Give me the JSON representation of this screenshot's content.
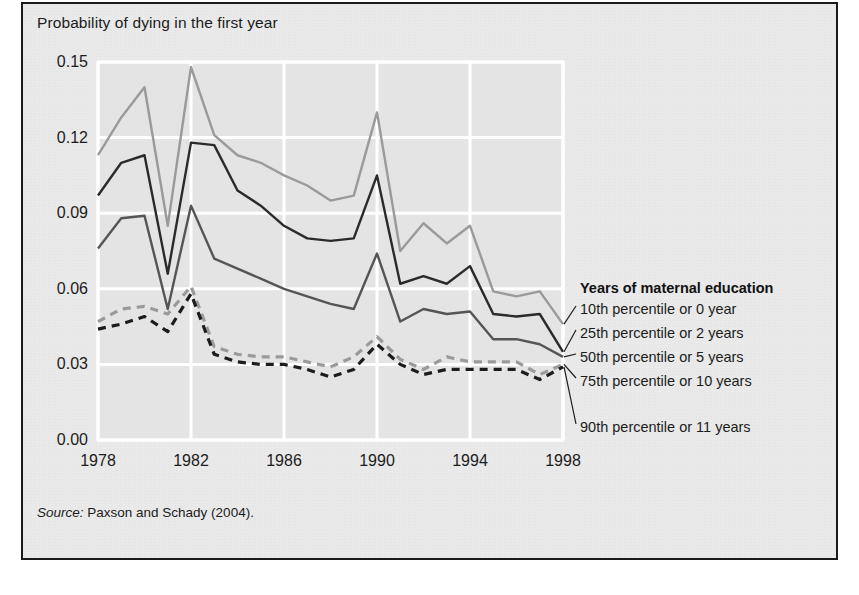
{
  "figure": {
    "axis_title": "Probability of dying in the first year",
    "source_label": "Source:",
    "source_text": " Paxson and Schady (2004)."
  },
  "legend": {
    "title": "Years of maternal education",
    "items": [
      {
        "label": "10th percentile or 0 year",
        "color": "#9a9a9a",
        "style": "solid"
      },
      {
        "label": "25th percentile or 2 years",
        "color": "#2b2b2b",
        "style": "solid"
      },
      {
        "label": "50th percentile or 5 years",
        "color": "#555555",
        "style": "solid"
      },
      {
        "label": "75th percentile or 10 years",
        "color": "#9a9a9a",
        "style": "dashed"
      },
      {
        "label": "90th percentile or 11 years",
        "color": "#1c1c1c",
        "style": "dashed"
      }
    ]
  },
  "chart_data": {
    "type": "line",
    "title": "",
    "xlabel": "",
    "ylabel": "Probability of dying in the first year",
    "xlim": [
      1978,
      1998
    ],
    "ylim": [
      0.0,
      0.15
    ],
    "xticks": [
      1978,
      1982,
      1986,
      1990,
      1994,
      1998
    ],
    "yticks": [
      0.0,
      0.03,
      0.06,
      0.09,
      0.12,
      0.15
    ],
    "ytick_labels": [
      "0.00",
      "0.03",
      "0.06",
      "0.09",
      "0.12",
      "0.15"
    ],
    "xtick_labels": [
      "1978",
      "1982",
      "1986",
      "1990",
      "1994",
      "1998"
    ],
    "grid": true,
    "grid_color": "#ffffff",
    "plot_background": "#e4e4e4",
    "legend_position": "right",
    "x": [
      1978,
      1979,
      1980,
      1981,
      1982,
      1983,
      1984,
      1985,
      1986,
      1987,
      1988,
      1989,
      1990,
      1991,
      1992,
      1993,
      1994,
      1995,
      1996,
      1997,
      1998
    ],
    "series": [
      {
        "name": "10th percentile or 0 year",
        "color": "#9a9a9a",
        "style": "solid",
        "values": [
          0.113,
          0.128,
          0.14,
          0.085,
          0.148,
          0.121,
          0.113,
          0.11,
          0.105,
          0.101,
          0.095,
          0.097,
          0.13,
          0.075,
          0.086,
          0.078,
          0.085,
          0.059,
          0.057,
          0.059,
          0.046
        ]
      },
      {
        "name": "25th percentile or 2 years",
        "color": "#2b2b2b",
        "style": "solid",
        "values": [
          0.097,
          0.11,
          0.113,
          0.066,
          0.118,
          0.117,
          0.099,
          0.093,
          0.085,
          0.08,
          0.079,
          0.08,
          0.105,
          0.062,
          0.065,
          0.062,
          0.069,
          0.05,
          0.049,
          0.05,
          0.035
        ]
      },
      {
        "name": "50th percentile or 5 years",
        "color": "#555555",
        "style": "solid",
        "values": [
          0.076,
          0.088,
          0.089,
          0.052,
          0.093,
          0.072,
          0.068,
          0.064,
          0.06,
          0.057,
          0.054,
          0.052,
          0.074,
          0.047,
          0.052,
          0.05,
          0.051,
          0.04,
          0.04,
          0.038,
          0.033
        ]
      },
      {
        "name": "75th percentile or 10 years",
        "color": "#9a9a9a",
        "style": "dashed",
        "values": [
          0.047,
          0.052,
          0.053,
          0.05,
          0.061,
          0.037,
          0.034,
          0.033,
          0.033,
          0.031,
          0.029,
          0.033,
          0.041,
          0.032,
          0.028,
          0.033,
          0.031,
          0.031,
          0.031,
          0.026,
          0.03
        ]
      },
      {
        "name": "90th percentile or 11 years",
        "color": "#1c1c1c",
        "style": "dashed",
        "values": [
          0.044,
          0.046,
          0.049,
          0.043,
          0.058,
          0.034,
          0.031,
          0.03,
          0.03,
          0.028,
          0.025,
          0.028,
          0.038,
          0.03,
          0.026,
          0.028,
          0.028,
          0.028,
          0.028,
          0.024,
          0.029
        ]
      }
    ]
  }
}
